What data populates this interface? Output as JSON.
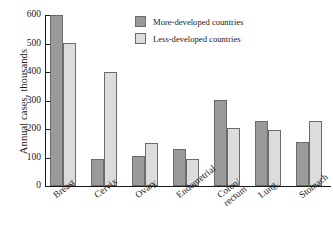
{
  "chart_data": {
    "type": "bar",
    "title": "",
    "subtitle": "",
    "xlabel": "",
    "ylabel": "Annual cases, thousands",
    "ylim": [
      0,
      600
    ],
    "yticks": [
      0,
      100,
      200,
      300,
      400,
      500,
      600
    ],
    "ytick_labels": [
      "0",
      "100",
      "200",
      "300",
      "400",
      "500",
      "600"
    ],
    "grid": false,
    "legend_position": "top-right",
    "categories": [
      "Breast",
      "Cervix",
      "Ovary",
      "Endometrial",
      "Colon/\nrectum",
      "Lung",
      "Stomach"
    ],
    "category_labels": [
      [
        "Breast"
      ],
      [
        "Cervix"
      ],
      [
        "Ovary"
      ],
      [
        "Endometrial"
      ],
      [
        "Colon/",
        "rectum"
      ],
      [
        "Lung"
      ],
      [
        "Stomach"
      ]
    ],
    "series": [
      {
        "name": "More-developed countries",
        "color": "#9a9a9a",
        "values": [
          600,
          95,
          105,
          130,
          303,
          228,
          155
        ]
      },
      {
        "name": "Less-developed countries",
        "color": "#dcdcdc",
        "values": [
          502,
          400,
          150,
          95,
          202,
          198,
          228
        ]
      }
    ]
  },
  "legend": {
    "items": [
      {
        "label": "More-developed countries"
      },
      {
        "label": "Less-developed countries"
      }
    ]
  },
  "colors": {
    "more_developed": "#9a9a9a",
    "less_developed": "#dcdcdc",
    "bar_outline": "#6b6b6b",
    "axis": "#1a1a1a",
    "background": "#ffffff"
  }
}
